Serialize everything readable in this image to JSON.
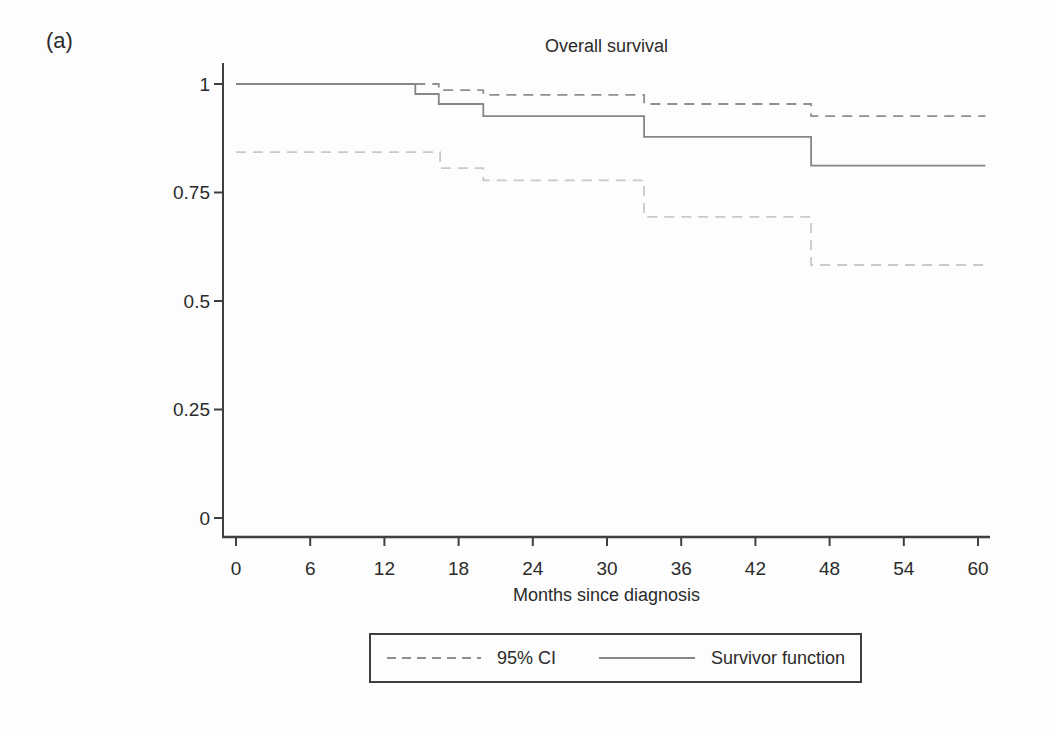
{
  "panel_label": "(a)",
  "chart_data": {
    "type": "line",
    "subtype": "kaplan-meier-step",
    "title": "Overall survival",
    "xlabel": "Months since diagnosis",
    "ylabel": "",
    "xlim": [
      0,
      60
    ],
    "ylim": [
      0,
      1
    ],
    "x_ticks": [
      0,
      6,
      12,
      18,
      24,
      30,
      36,
      42,
      48,
      54,
      60
    ],
    "y_ticks": [
      0,
      0.25,
      0.5,
      0.75,
      1
    ],
    "y_tick_labels": [
      "0",
      "0.25",
      "0.5",
      "0.75",
      "1"
    ],
    "grid": false,
    "legend_position": "bottom-center-boxed",
    "end_t": 60.6,
    "series": [
      {
        "name": "Survivor function",
        "style": "solid",
        "color": "#868686",
        "points": [
          [
            0,
            1.0
          ],
          [
            14.5,
            0.977
          ],
          [
            16.4,
            0.954
          ],
          [
            20,
            0.926
          ],
          [
            33,
            0.878
          ],
          [
            46.5,
            0.812
          ]
        ]
      },
      {
        "name": "95% CI upper",
        "style": "dashed",
        "color": "#8f8f8f",
        "points": [
          [
            14.5,
            1.0
          ],
          [
            16.4,
            0.986
          ],
          [
            20,
            0.975
          ],
          [
            33,
            0.954
          ],
          [
            46.5,
            0.926
          ]
        ]
      },
      {
        "name": "95% CI lower",
        "style": "dashed",
        "color": "#c9c9c9",
        "points": [
          [
            0,
            0.843
          ],
          [
            16.5,
            0.806
          ],
          [
            20,
            0.778
          ],
          [
            33,
            0.694
          ],
          [
            46.5,
            0.583
          ]
        ]
      }
    ],
    "legend": [
      {
        "label": "95% CI",
        "style": "dashed"
      },
      {
        "label": "Survivor function",
        "style": "solid"
      }
    ],
    "colors": {
      "axis": "#3f3f3f",
      "tick_text": "#2b2b2b",
      "background": "#fdfdfd"
    }
  }
}
